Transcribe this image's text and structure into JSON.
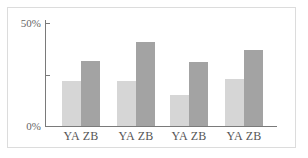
{
  "chart_data": {
    "type": "bar",
    "title": "",
    "xlabel": "",
    "ylabel": "",
    "ylim": [
      0,
      50
    ],
    "yticks": [
      {
        "value": 0,
        "label": "0%"
      },
      {
        "value": 25,
        "label": ""
      },
      {
        "value": 50,
        "label": "50%"
      }
    ],
    "categories": [
      "YA ZB",
      "YA ZB",
      "YA ZB",
      "YA ZB"
    ],
    "series": [
      {
        "name": "YA",
        "color": "#d6d6d6",
        "values": [
          22,
          22,
          15,
          23
        ]
      },
      {
        "name": "ZB",
        "color": "#a3a3a3",
        "values": [
          31.5,
          41,
          31,
          37
        ]
      }
    ],
    "grid": false,
    "legend": "none"
  }
}
